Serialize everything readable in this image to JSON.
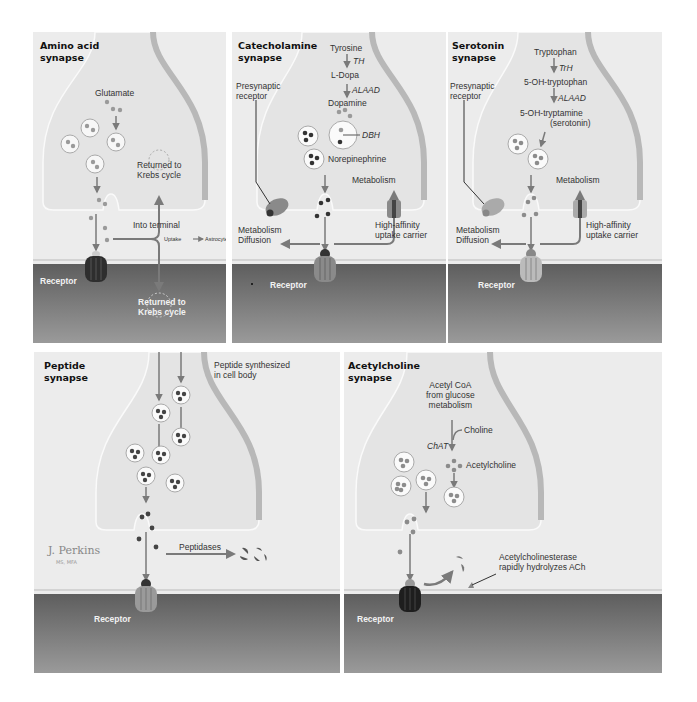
{
  "figure": {
    "panels": [
      {
        "title_line1": "Amino acid",
        "title_line2": "synapse",
        "labels": {
          "neurotransmitter": "Glutamate",
          "returned_top_1": "Returned to",
          "returned_top_2": "Krebs cycle",
          "into_terminal": "Into terminal",
          "uptake": "Uptake",
          "astrocyte": "Astrocyte",
          "receptor": "Receptor",
          "returned_bottom_1": "Returned to",
          "returned_bottom_2": "Krebs cycle"
        }
      },
      {
        "title_line1": "Catecholamine",
        "title_line2": "synapse",
        "labels": {
          "precursor": "Tyrosine",
          "enzyme1": "TH",
          "intermediate": "L-Dopa",
          "enzyme2": "ALAAD",
          "product": "Dopamine",
          "enzyme3": "DBH",
          "final": "Norepinephrine",
          "presynaptic_1": "Presynaptic",
          "presynaptic_2": "receptor",
          "metabolism_top": "Metabolism",
          "metabolism_left": "Metabolism",
          "diffusion": "Diffusion",
          "uptake_1": "High-affinity",
          "uptake_2": "uptake carrier",
          "receptor": "Receptor"
        }
      },
      {
        "title_line1": "Serotonin",
        "title_line2": "synapse",
        "labels": {
          "precursor": "Tryptophan",
          "enzyme1": "TrH",
          "intermediate": "5-OH-tryptophan",
          "enzyme2": "ALAAD",
          "product_1": "5-OH-tryptamine",
          "product_2": "(serotonin)",
          "presynaptic_1": "Presynaptic",
          "presynaptic_2": "receptor",
          "metabolism_top": "Metabolism",
          "metabolism_left": "Metabolism",
          "diffusion": "Diffusion",
          "uptake_1": "High-affinity",
          "uptake_2": "uptake carrier",
          "receptor": "Receptor"
        }
      },
      {
        "title_line1": "Peptide",
        "title_line2": "synapse",
        "labels": {
          "synth_1": "Peptide synthesized",
          "synth_2": "in cell body",
          "peptidases": "Peptidases",
          "receptor": "Receptor",
          "signature": "J. Perkins",
          "signature_sub": "MS, MFA"
        }
      },
      {
        "title_line1": "Acetylcholine",
        "title_line2": "synapse",
        "labels": {
          "source_1": "Acetyl CoA",
          "source_2": "from glucose",
          "source_3": "metabolism",
          "choline": "Choline",
          "enzyme": "ChAT",
          "product": "Acetylcholine",
          "esterase_1": "Acetylcholinesterase",
          "esterase_2": "rapidly hydrolyzes ACh",
          "receptor": "Receptor"
        }
      }
    ],
    "colors": {
      "background": "#ececec",
      "terminal_fill": "#e6e6e6",
      "postsynaptic": "#6e6e6e",
      "receptor_dark": "#2a2a2a",
      "receptor_light": "#9a9a9a",
      "arrow": "#7a7a7a",
      "molecule": "#8c8c8c",
      "molecule_dark": "#3a3a3a"
    }
  }
}
